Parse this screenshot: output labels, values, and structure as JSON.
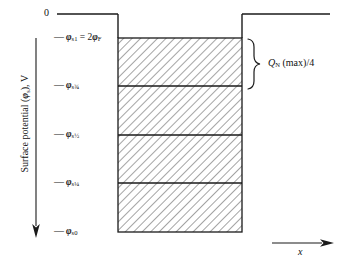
{
  "figure": {
    "type": "technical-diagram"
  },
  "axes": {
    "y": {
      "label": "Surface potential (",
      "label_symbol": "φ",
      "label_symbol_sub": "s",
      "label_tail": "), V",
      "direction": "downward-arrow",
      "zero_label": "0"
    },
    "x": {
      "label": "x",
      "direction": "rightward-arrow"
    }
  },
  "ticks": [
    {
      "id": "phi-s1",
      "dash": "—",
      "symbol": "φ",
      "sub": "s1",
      "equals": " = 2",
      "symbol2": "φ",
      "sub2": "F",
      "y": 38
    },
    {
      "id": "phi-s34",
      "dash": "—",
      "symbol": "φ",
      "sub": "s",
      "frac": "¾",
      "y": 86
    },
    {
      "id": "phi-s12",
      "dash": "—",
      "symbol": "φ",
      "sub": "s",
      "frac": "½",
      "y": 135
    },
    {
      "id": "phi-s14",
      "dash": "—",
      "symbol": "φ",
      "sub": "s",
      "frac": "¼",
      "y": 183
    },
    {
      "id": "phi-s0",
      "dash": "—",
      "symbol": "φ",
      "sub": "s0",
      "y": 232
    }
  ],
  "annotation": {
    "brace_label_symbol": "Q",
    "brace_label_sub": "N",
    "brace_label_rest": " (max)/4"
  },
  "colors": {
    "line": "#1a1a1a",
    "hatch": "#555555",
    "background": "#ffffff"
  },
  "geometry": {
    "box_left": 118,
    "box_right": 242,
    "box_top": 38,
    "box_bottom": 232,
    "zero_line_y": 14,
    "band_count": 4
  }
}
